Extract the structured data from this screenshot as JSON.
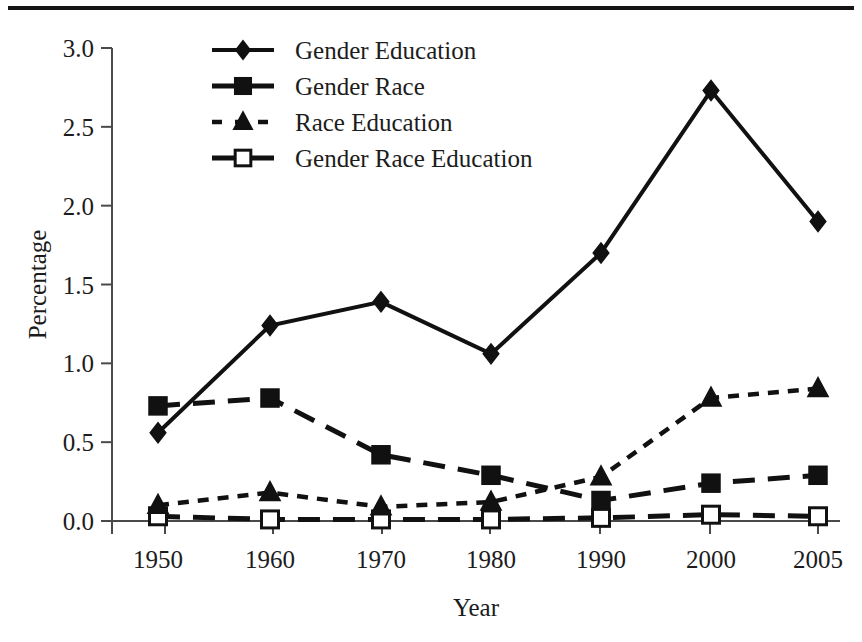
{
  "chart_data": {
    "type": "line",
    "title": "",
    "xlabel": "Year",
    "ylabel": "Percentage",
    "categories": [
      "1950",
      "1960",
      "1970",
      "1980",
      "1990",
      "2000",
      "2005"
    ],
    "x": [
      1950,
      1960,
      1970,
      1980,
      1990,
      2000,
      2005
    ],
    "xlim": [
      1945,
      2010
    ],
    "ylim": [
      0.0,
      3.0
    ],
    "ytick_labels": [
      "0.0",
      "0.5",
      "1.0",
      "1.5",
      "2.0",
      "2.5",
      "3.0"
    ],
    "ytick_values": [
      0.0,
      0.5,
      1.0,
      1.5,
      2.0,
      2.5,
      3.0
    ],
    "grid": false,
    "legend_position": "top-center",
    "series": [
      {
        "name": "Gender Education",
        "marker": "filled-diamond",
        "linestyle": "solid",
        "color": "#111111",
        "values": [
          0.56,
          1.24,
          1.39,
          1.06,
          1.7,
          2.73,
          1.9
        ]
      },
      {
        "name": "Gender Race",
        "marker": "filled-square",
        "linestyle": "long-dash",
        "color": "#111111",
        "values": [
          0.73,
          0.78,
          0.42,
          0.29,
          0.13,
          0.24,
          0.29
        ]
      },
      {
        "name": "Race Education",
        "marker": "filled-triangle",
        "linestyle": "short-dash",
        "color": "#111111",
        "values": [
          0.1,
          0.18,
          0.09,
          0.12,
          0.28,
          0.78,
          0.84
        ]
      },
      {
        "name": "Gender Race Education",
        "marker": "open-square",
        "linestyle": "long-dash",
        "color": "#111111",
        "values": [
          0.03,
          0.01,
          0.01,
          0.01,
          0.02,
          0.04,
          0.03
        ]
      }
    ]
  }
}
